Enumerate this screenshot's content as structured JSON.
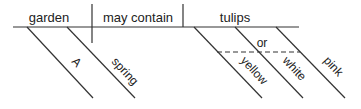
{
  "diagram": {
    "type": "sentence-diagram",
    "sentence": "A spring garden may contain yellow, white, or pink tulips",
    "line_color": "#333333",
    "text_color": "#222222",
    "baseline": {
      "subject": "garden",
      "verb": "may contain",
      "object": "tulips"
    },
    "subject_modifiers": [
      "A",
      "spring"
    ],
    "object_modifiers": {
      "items": [
        "yellow",
        "white",
        "pink"
      ],
      "conjunction": "or"
    }
  }
}
